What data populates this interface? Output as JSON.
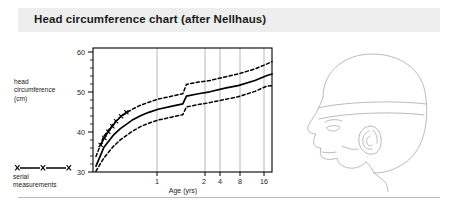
{
  "header": {
    "title": "Head circumference chart (after Nellhaus)",
    "band_color": "#eeeeee"
  },
  "y_axis_caption": {
    "line1": "head",
    "line2": "circumference",
    "line3": "(cm)"
  },
  "legend": {
    "symbol_label": "X—X—X",
    "caption_line1": "serial",
    "caption_line2": "measurements",
    "marker": "x-marker-icon"
  },
  "illustration": {
    "name": "infant-head-profile-with-tape-measure",
    "stroke_color": "#b0b0b0"
  },
  "footer": {
    "rule_color": "#b9b9b9"
  },
  "chart_data": {
    "type": "line",
    "title": "Head circumference chart (after Nellhaus)",
    "xlabel": "Age (yrs)",
    "ylabel": "head circumference (cm)",
    "x_scale": "log",
    "xlim": [
      0.0,
      18.0
    ],
    "ylim": [
      30,
      62
    ],
    "y_ticks": [
      30,
      40,
      50,
      60
    ],
    "y_minor_tick_step": 2,
    "x_ticks": [
      1,
      2,
      4,
      8,
      16
    ],
    "x_tick_labels": [
      "1",
      "2",
      "4",
      "8",
      "16"
    ],
    "grid": "vertical-only",
    "legend_position": "outside-bottom-left",
    "series": [
      {
        "name": "97th percentile",
        "style": "dashed",
        "color": "#000000",
        "x": [
          0.02,
          0.08,
          0.17,
          0.25,
          0.42,
          0.58,
          0.75,
          1.0,
          1.5,
          2.0,
          2.2,
          3.0,
          4.0,
          6.0,
          8.0,
          12.0,
          16.0,
          18.0
        ],
        "y": [
          34.0,
          39.2,
          42.4,
          44.2,
          46.2,
          47.3,
          48.0,
          48.8,
          49.6,
          50.2,
          52.6,
          53.2,
          53.6,
          54.6,
          55.3,
          56.6,
          57.9,
          58.5
        ]
      },
      {
        "name": "50th percentile",
        "style": "solid",
        "color": "#000000",
        "x": [
          0.02,
          0.08,
          0.17,
          0.25,
          0.42,
          0.58,
          0.75,
          1.0,
          1.5,
          2.0,
          2.2,
          3.0,
          4.0,
          6.0,
          8.0,
          12.0,
          16.0,
          18.0
        ],
        "y": [
          31.5,
          36.3,
          39.5,
          41.2,
          43.4,
          44.6,
          45.4,
          46.2,
          47.0,
          47.6,
          49.6,
          50.2,
          50.7,
          51.7,
          52.3,
          53.6,
          54.9,
          55.3
        ]
      },
      {
        "name": "3rd percentile",
        "style": "dashed",
        "color": "#000000",
        "x": [
          0.02,
          0.08,
          0.17,
          0.25,
          0.42,
          0.58,
          0.75,
          1.0,
          1.5,
          2.0,
          2.2,
          3.0,
          4.0,
          6.0,
          8.0,
          12.0,
          16.0,
          18.0
        ],
        "y": [
          30.2,
          33.6,
          36.6,
          38.3,
          40.5,
          41.8,
          42.6,
          43.4,
          44.2,
          44.8,
          46.8,
          47.4,
          47.9,
          48.8,
          49.4,
          50.8,
          52.2,
          52.3
        ]
      },
      {
        "name": "serial measurements",
        "style": "markers-with-line",
        "marker": "x",
        "color": "#000000",
        "x": [
          0.055,
          0.085,
          0.12,
          0.16,
          0.2,
          0.26,
          0.33
        ],
        "y": [
          37.0,
          38.8,
          40.4,
          41.8,
          43.1,
          44.4,
          45.4
        ]
      }
    ]
  }
}
